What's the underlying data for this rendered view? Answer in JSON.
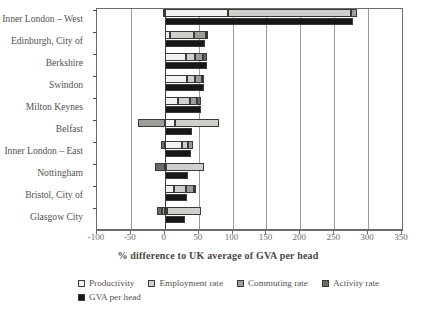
{
  "chart_data": {
    "type": "bar",
    "orientation": "horizontal",
    "stacked": true,
    "title": "",
    "xlabel": "% difference to UK average of GVA per head",
    "ylabel": "",
    "xlim": [
      -100,
      350
    ],
    "xticks": [
      -100,
      -50,
      0,
      50,
      100,
      150,
      200,
      250,
      300,
      350
    ],
    "xticklabels": [
      "-100",
      "-50",
      "0",
      "50",
      "100",
      "150",
      "200",
      "250",
      "300",
      "350"
    ],
    "grid": true,
    "legend_position": "bottom",
    "categories": [
      "Inner London – West",
      "Edinburgh, City of",
      "Berkshire",
      "Swindon",
      "Milton Keynes",
      "Belfast",
      "Inner London – East",
      "Nottingham",
      "Bristol, City of",
      "Glasgow City"
    ],
    "series": [
      {
        "name": "Productivity",
        "color": "#f2f2f0",
        "values": [
          93,
          7,
          32,
          33,
          20,
          15,
          26,
          2,
          14,
          3
        ]
      },
      {
        "name": "Employment rate",
        "color": "#cfcfcb",
        "values": [
          182,
          36,
          13,
          11,
          17,
          65,
          8,
          56,
          18,
          50
        ]
      },
      {
        "name": "Commuting rate",
        "color": "#9d9d99",
        "values": [
          8,
          18,
          11,
          11,
          11,
          -40,
          8,
          0,
          11,
          -4
        ]
      },
      {
        "name": "Activity rate",
        "color": "#6a6a66",
        "values": [
          -3,
          2,
          7,
          3,
          6,
          0,
          -5,
          -15,
          2,
          -8
        ]
      },
      {
        "name": "GVA per head",
        "color": "#171717",
        "values": [
          278,
          60,
          62,
          58,
          54,
          40,
          38,
          35,
          33,
          30
        ]
      }
    ]
  },
  "legend": {
    "items": [
      {
        "label": "Productivity",
        "swatch": "#f2f2f0"
      },
      {
        "label": "Employment rate",
        "swatch": "#cfcfcb"
      },
      {
        "label": "Commuting rate",
        "swatch": "#9d9d99"
      },
      {
        "label": "Activity rate",
        "swatch": "#6a6a66"
      },
      {
        "label": "GVA per head",
        "swatch": "#171717"
      }
    ]
  }
}
